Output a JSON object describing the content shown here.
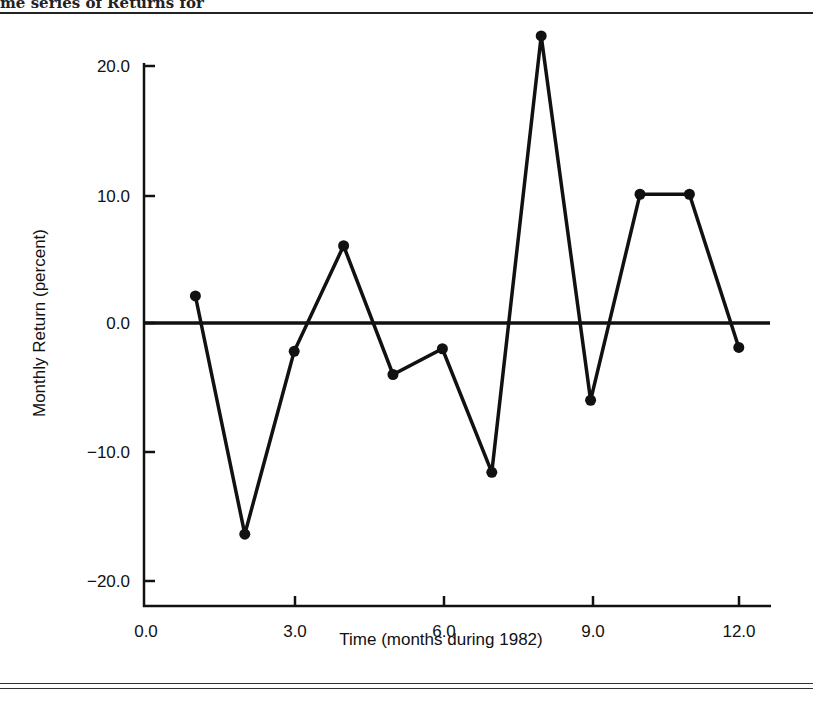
{
  "caption_fragment": "me series of Returns for",
  "chart_data": {
    "type": "line",
    "title": "",
    "xlabel": "Time (months during 1982)",
    "ylabel": "Monthly Return (percent)",
    "xlim": [
      0,
      12.5
    ],
    "ylim": [
      -22,
      22
    ],
    "x_ticks": [
      "0.0",
      "3.0",
      "6.0",
      "9.0",
      "12.0"
    ],
    "y_ticks": [
      "20.0",
      "10.0",
      "0.0",
      "−10.0",
      "−20.0"
    ],
    "grid": false,
    "zero_line": true,
    "legend": null,
    "series": [
      {
        "name": "Monthly Return",
        "x": [
          1,
          2,
          3,
          4,
          5,
          6,
          7,
          8,
          9,
          10,
          11,
          12
        ],
        "values": [
          2.1,
          -16.4,
          -2.2,
          6.0,
          -4.0,
          -2.0,
          -11.6,
          22.3,
          -6.0,
          10.0,
          10.0,
          -1.9
        ]
      }
    ]
  }
}
